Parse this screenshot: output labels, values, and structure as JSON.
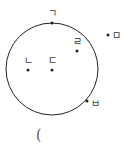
{
  "diagram": {
    "circle": {
      "cx": 52,
      "cy": 69,
      "r": 46,
      "stroke": "#222222"
    },
    "points": [
      {
        "id": "giyeok",
        "label": "ㄱ",
        "x": 52,
        "y": 23,
        "lx": 48,
        "ly": 17
      },
      {
        "id": "nieun",
        "label": "ㄴ",
        "x": 28,
        "y": 70,
        "lx": 24,
        "ly": 64
      },
      {
        "id": "digeut",
        "label": "ㄷ",
        "x": 52,
        "y": 70,
        "lx": 48,
        "ly": 64
      },
      {
        "id": "rieul",
        "label": "ㄹ",
        "x": 77,
        "y": 51,
        "lx": 73,
        "ly": 45
      },
      {
        "id": "mieum",
        "label": "ㅁ",
        "x": 108,
        "y": 35,
        "lx": 112,
        "ly": 39
      },
      {
        "id": "bieup",
        "label": "ㅂ",
        "x": 87,
        "y": 101,
        "lx": 91,
        "ly": 107
      }
    ],
    "partial_text": "("
  }
}
